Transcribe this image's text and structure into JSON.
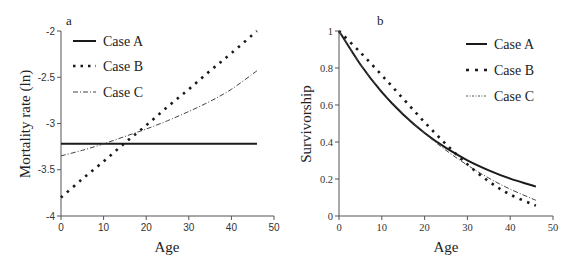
{
  "chart_data": [
    {
      "panel": "a",
      "type": "line",
      "title": "",
      "xlabel": "Age",
      "ylabel": "Mortality rate (ln)",
      "xlim": [
        0,
        50
      ],
      "ylim": [
        -4,
        -2
      ],
      "xticks": [
        "0",
        "10",
        "20",
        "30",
        "40",
        "50"
      ],
      "yticks": [
        "-2",
        "-2.5",
        "-3",
        "-3.5",
        "-4"
      ],
      "grid": false,
      "legend_position": "upper left",
      "x": [
        0,
        5,
        10,
        15,
        20,
        25,
        30,
        35,
        40,
        46
      ],
      "series": [
        {
          "name": "Case A",
          "style": "solid",
          "values": [
            -3.22,
            -3.22,
            -3.22,
            -3.22,
            -3.22,
            -3.22,
            -3.22,
            -3.22,
            -3.22,
            -3.22
          ]
        },
        {
          "name": "Case B",
          "style": "dotted",
          "values": [
            -3.8,
            -3.6,
            -3.41,
            -3.21,
            -3.02,
            -2.82,
            -2.63,
            -2.43,
            -2.24,
            -2.0
          ]
        },
        {
          "name": "Case C",
          "style": "dashdot",
          "values": [
            -3.35,
            -3.29,
            -3.22,
            -3.14,
            -3.06,
            -2.97,
            -2.87,
            -2.76,
            -2.63,
            -2.43
          ]
        }
      ]
    },
    {
      "panel": "b",
      "type": "line",
      "title": "",
      "xlabel": "Age",
      "ylabel": "Survivorship",
      "xlim": [
        0,
        50
      ],
      "ylim": [
        0,
        1
      ],
      "xticks": [
        "0",
        "10",
        "20",
        "30",
        "40",
        "50"
      ],
      "yticks": [
        "1",
        "0.8",
        "0.6",
        "0.4",
        "0.2",
        "0"
      ],
      "grid": false,
      "legend_position": "upper right",
      "x": [
        0,
        5,
        10,
        15,
        20,
        25,
        30,
        35,
        40,
        46
      ],
      "series": [
        {
          "name": "Case A",
          "style": "solid",
          "values": [
            1.0,
            0.819,
            0.67,
            0.549,
            0.449,
            0.368,
            0.301,
            0.247,
            0.202,
            0.159
          ]
        },
        {
          "name": "Case B",
          "style": "dotted",
          "values": [
            1.0,
            0.884,
            0.761,
            0.634,
            0.507,
            0.388,
            0.279,
            0.187,
            0.116,
            0.056
          ]
        },
        {
          "name": "Case C",
          "style": "dashdot",
          "values": [
            1.0,
            0.82,
            0.675,
            0.552,
            0.447,
            0.355,
            0.275,
            0.205,
            0.145,
            0.085
          ]
        }
      ]
    }
  ],
  "panels": {
    "a": {
      "label": "a",
      "xlabel": "Age",
      "ylabel": "Mortality rate (ln)",
      "legend": [
        "Case A",
        "Case B",
        "Case C"
      ]
    },
    "b": {
      "label": "b",
      "xlabel": "Age",
      "ylabel": "Survivorship",
      "legend": [
        "Case A",
        "Case B",
        "Case C"
      ]
    }
  },
  "colors": {
    "line": "#1a1a1a",
    "axis": "#555555"
  }
}
